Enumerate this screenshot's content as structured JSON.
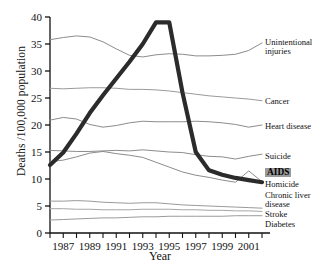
{
  "chart_data": {
    "type": "line",
    "title": "",
    "xlabel": "Year",
    "ylabel": "Deaths /100,000 population",
    "xlim": [
      1986,
      2002
    ],
    "ylim": [
      0,
      40
    ],
    "yticks": [
      0,
      5,
      10,
      15,
      20,
      25,
      30,
      35,
      40
    ],
    "xticks": [
      1987,
      1989,
      1991,
      1993,
      1995,
      1997,
      1999,
      2001
    ],
    "xtick_labels": [
      "1987",
      "1989",
      "1991",
      "1993",
      "1995",
      "1997",
      "1999",
      "2001"
    ],
    "minor_xticks_every": 1,
    "grid": false,
    "legend_position": "right-of-axes",
    "highlight_series": "AIDS",
    "x": [
      1986,
      1987,
      1988,
      1989,
      1990,
      1991,
      1992,
      1993,
      1994,
      1995,
      1996,
      1997,
      1998,
      1999,
      2000,
      2001,
      2002
    ],
    "series": [
      {
        "name": "AIDS",
        "color": "#2b2b2b",
        "width": 4.2,
        "label": "AIDS",
        "values": [
          12.6,
          14.9,
          18.4,
          22.2,
          25.5,
          28.6,
          31.7,
          35.0,
          39.0,
          39.0,
          26.0,
          15.0,
          11.6,
          10.8,
          10.2,
          9.8,
          9.4
        ]
      },
      {
        "name": "Unintentional injuries",
        "color": "#8c8c8c",
        "width": 1.0,
        "label": "Unintentional injuries",
        "values": [
          35.8,
          36.2,
          36.5,
          36.3,
          35.4,
          34.1,
          32.9,
          32.6,
          33.0,
          33.2,
          33.1,
          32.8,
          32.8,
          32.9,
          33.1,
          33.8,
          35.2
        ]
      },
      {
        "name": "Cancer",
        "color": "#9a9a9a",
        "width": 1.0,
        "label": "Cancer",
        "values": [
          26.8,
          26.7,
          26.8,
          26.9,
          26.9,
          26.8,
          26.6,
          26.6,
          26.5,
          26.3,
          26.0,
          25.7,
          25.4,
          25.2,
          25.0,
          24.8,
          24.5
        ]
      },
      {
        "name": "Heart disease",
        "color": "#8c8c8c",
        "width": 1.0,
        "label": "Heart disease",
        "values": [
          20.9,
          21.4,
          21.1,
          20.1,
          19.6,
          19.9,
          20.4,
          20.7,
          20.6,
          20.6,
          20.6,
          20.7,
          20.6,
          20.4,
          20.1,
          19.6,
          20.0
        ]
      },
      {
        "name": "Suicide",
        "color": "#8c8c8c",
        "width": 1.0,
        "label": "Suicide",
        "values": [
          15.3,
          15.2,
          15.1,
          15.1,
          15.2,
          15.3,
          15.2,
          15.4,
          15.2,
          15.0,
          14.9,
          14.5,
          14.2,
          14.1,
          13.7,
          14.2,
          14.6
        ]
      },
      {
        "name": "Homicide",
        "color": "#8c8c8c",
        "width": 1.0,
        "label": "Homicide",
        "values": [
          13.2,
          13.5,
          14.1,
          14.8,
          15.1,
          14.7,
          14.4,
          14.0,
          13.1,
          12.2,
          11.3,
          10.7,
          10.3,
          9.8,
          9.4,
          11.5,
          9.5
        ]
      },
      {
        "name": "Chronic liver disease",
        "color": "#9a9a9a",
        "width": 1.0,
        "label": "Chronic liver disease",
        "values": [
          5.9,
          5.9,
          6.0,
          5.9,
          5.7,
          5.6,
          5.5,
          5.6,
          5.6,
          5.4,
          5.2,
          5.1,
          5.0,
          4.9,
          4.8,
          4.7,
          4.6
        ]
      },
      {
        "name": "Stroke",
        "color": "#a6a6a6",
        "width": 1.0,
        "label": "Stroke",
        "values": [
          4.5,
          4.5,
          4.4,
          4.4,
          4.3,
          4.3,
          4.3,
          4.4,
          4.4,
          4.4,
          4.3,
          4.3,
          4.2,
          4.2,
          4.1,
          4.1,
          4.0
        ]
      },
      {
        "name": "Diabetes",
        "color": "#9a9a9a",
        "width": 1.0,
        "label": "Diabetes",
        "values": [
          2.4,
          2.5,
          2.6,
          2.7,
          2.8,
          2.8,
          2.9,
          3.0,
          3.0,
          3.1,
          3.1,
          3.1,
          3.1,
          3.1,
          3.2,
          3.2,
          3.2
        ]
      }
    ],
    "legend_entries": [
      {
        "label": "Unintentional injuries",
        "highlighted": false
      },
      {
        "label": "Cancer",
        "highlighted": false
      },
      {
        "label": "Heart disease",
        "highlighted": false
      },
      {
        "label": "Suicide",
        "highlighted": false
      },
      {
        "label": "AIDS",
        "highlighted": true
      },
      {
        "label": "Homicide",
        "highlighted": false
      },
      {
        "label": "Chronic liver disease",
        "highlighted": false
      },
      {
        "label": "Stroke",
        "highlighted": false
      },
      {
        "label": "Diabetes",
        "highlighted": false
      }
    ]
  },
  "axes": {
    "ylabel": "Deaths /100,000 population",
    "xlabel": "Year"
  },
  "legend": {
    "unintentional_line1": "Unintentional",
    "unintentional_line2": "injuries",
    "cancer": "Cancer",
    "heart_disease": "Heart disease",
    "suicide": "Suicide",
    "aids": "AIDS",
    "homicide": "Homicide",
    "chronic_liver_line1": "Chronic liver",
    "chronic_liver_line2": "disease",
    "stroke": "Stroke",
    "diabetes": "Diabetes"
  }
}
